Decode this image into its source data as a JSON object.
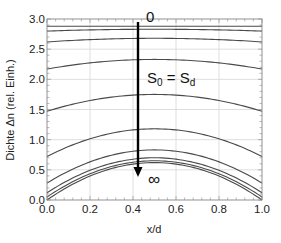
{
  "chart_data": {
    "type": "line",
    "title": "",
    "xlabel": "x/d",
    "ylabel": "Dichte Δn (rel. Einh.)",
    "xlim": [
      0.0,
      1.0
    ],
    "ylim": [
      0.0,
      3.0
    ],
    "xticks": [
      "0.0",
      "0.2",
      "0.4",
      "0.6",
      "0.8",
      "1.0"
    ],
    "yticks": [
      "0.0",
      "0.5",
      "1.0",
      "1.5",
      "2.0",
      "2.5",
      "3.0"
    ],
    "grid": true,
    "legend": null,
    "x": [
      0.0,
      0.1,
      0.2,
      0.3,
      0.4,
      0.5,
      0.6,
      0.7,
      0.8,
      0.9,
      1.0
    ],
    "series": [
      {
        "name": "curve-1",
        "edge": 2.88,
        "peak": 2.88
      },
      {
        "name": "curve-2",
        "edge": 2.8,
        "peak": 2.83
      },
      {
        "name": "curve-3",
        "edge": 2.62,
        "peak": 2.68
      },
      {
        "name": "curve-4",
        "edge": 2.17,
        "peak": 2.33
      },
      {
        "name": "curve-5",
        "edge": 1.47,
        "peak": 1.75
      },
      {
        "name": "curve-6",
        "edge": 0.72,
        "peak": 1.18
      },
      {
        "name": "curve-7",
        "edge": 0.28,
        "peak": 0.83
      },
      {
        "name": "curve-8",
        "edge": 0.12,
        "peak": 0.7
      },
      {
        "name": "curve-9",
        "edge": 0.05,
        "peak": 0.65
      },
      {
        "name": "curve-10",
        "edge": 0.0,
        "peak": 0.62
      }
    ],
    "annotations": {
      "arrow": {
        "x": 0.42,
        "y_start": 2.95,
        "y_end": 0.42
      },
      "start_label": "0",
      "end_label": "∞",
      "condition_label_main": "S",
      "condition_label_sub0": "0",
      "condition_label_eq": " = S",
      "condition_label_subd": "d"
    }
  }
}
